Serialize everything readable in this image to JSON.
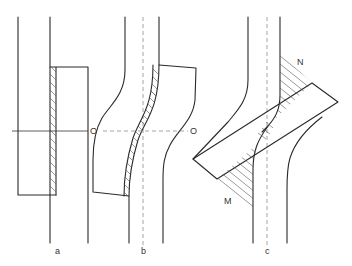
{
  "figure": {
    "panels": [
      {
        "id": "a",
        "label": "a",
        "description": "Two offset straight bars joined by a hatched straight contact zone"
      },
      {
        "id": "b",
        "label": "b",
        "description": "Bars bent into S-shape, hatched curved contact zone along centre O-O"
      },
      {
        "id": "c",
        "label": "c",
        "description": "Tilted crossing bar with hatched regions N and M"
      }
    ],
    "labels": {
      "panel_a": "a",
      "panel_b": "b",
      "panel_c": "c",
      "axis_left": "O",
      "axis_right": "O",
      "region_n": "N",
      "region_m": "M"
    },
    "colors": {
      "line": "#2a2a2a",
      "dashed": "#9a9a9a",
      "hatch": "#555555",
      "background": "#ffffff"
    }
  }
}
